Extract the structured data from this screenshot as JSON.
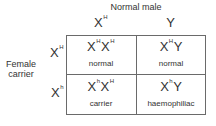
{
  "diagram": {
    "type": "punnett-square",
    "title": "Normal male",
    "side_label_line1": "Female",
    "side_label_line2": "carrier",
    "columns": [
      {
        "base": "X",
        "sup": "H"
      },
      {
        "base": "Y",
        "sup": ""
      }
    ],
    "rows": [
      {
        "base": "X",
        "sup": "H"
      },
      {
        "base": "X",
        "sup": "h"
      }
    ],
    "cells": [
      [
        {
          "a": "X",
          "a_sup": "H",
          "b": "X",
          "b_sup": "H",
          "phenotype": "normal"
        },
        {
          "a": "X",
          "a_sup": "H",
          "b": "Y",
          "b_sup": "",
          "phenotype": "normal"
        }
      ],
      [
        {
          "a": "X",
          "a_sup": "h",
          "b": "X",
          "b_sup": "H",
          "phenotype": "carrier"
        },
        {
          "a": "X",
          "a_sup": "h",
          "b": "Y",
          "b_sup": "",
          "phenotype": "haemophiliac"
        }
      ]
    ],
    "colors": {
      "grid_line": "#6a6a6a",
      "text": "#333333",
      "background": "#ffffff"
    }
  }
}
